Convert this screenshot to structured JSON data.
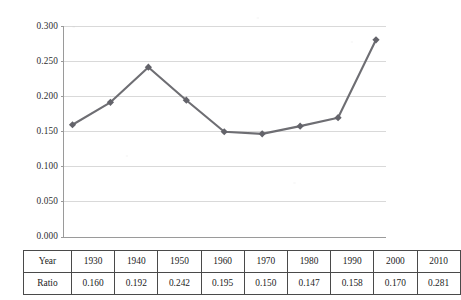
{
  "chart_data": {
    "type": "line",
    "title": "",
    "subtitle": "",
    "xlabel": "Year",
    "ylabel": "Ratio",
    "categories": [
      "1930",
      "1940",
      "1950",
      "1960",
      "1970",
      "1980",
      "1990",
      "2000",
      "2010"
    ],
    "values": [
      0.16,
      0.192,
      0.242,
      0.195,
      0.15,
      0.147,
      0.158,
      0.17,
      0.281
    ],
    "series": [
      {
        "name": "Ratio",
        "values": [
          0.16,
          0.192,
          0.242,
          0.195,
          0.15,
          0.147,
          0.158,
          0.17,
          0.281
        ]
      }
    ],
    "ylim": [
      0.0,
      0.3
    ],
    "yticks": [
      0.0,
      0.05,
      0.1,
      0.15,
      0.2,
      0.25,
      0.3
    ],
    "ytick_labels": [
      "0.000",
      "0.050",
      "0.100",
      "0.150",
      "0.200",
      "0.250",
      "0.300"
    ],
    "xtick_labels": [],
    "grid": "horizontal",
    "legend": "none",
    "marker": "diamond",
    "line_color": "#6e6e73",
    "marker_color": "#63636a",
    "grid_color": "#d9d9d9",
    "axis_color": "#9a9a9a"
  },
  "table": {
    "rows": [
      {
        "header": "Year",
        "cells": [
          "1930",
          "1940",
          "1950",
          "1960",
          "1970",
          "1980",
          "1990",
          "2000",
          "2010"
        ]
      },
      {
        "header": "Ratio",
        "cells": [
          "0.160",
          "0.192",
          "0.242",
          "0.195",
          "0.150",
          "0.147",
          "0.158",
          "0.170",
          "0.281"
        ]
      }
    ]
  }
}
